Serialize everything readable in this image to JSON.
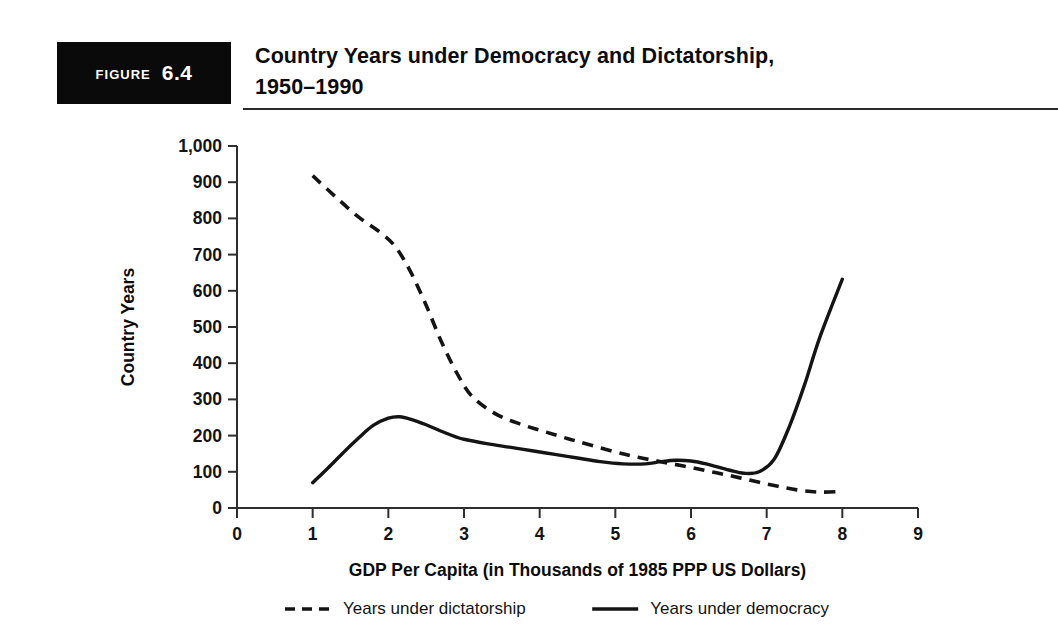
{
  "figure": {
    "tag_word": "Figure",
    "tag_number": "6.4",
    "title_line1": "Country Years under Democracy and Dictatorship,",
    "title_line2": "1950–1990"
  },
  "colors": {
    "tag_background": "#0a0a0a",
    "tag_text": "#ffffff",
    "ink": "#141414",
    "rule": "#2a2a2a",
    "page_background": "#ffffff"
  },
  "chart_data": {
    "type": "line",
    "title": "Country Years under Democracy and Dictatorship, 1950–1990",
    "xlabel": "GDP Per Capita (in Thousands of 1985 PPP US Dollars)",
    "ylabel": "Country Years",
    "xlim": [
      0,
      9
    ],
    "ylim": [
      0,
      1000
    ],
    "xticks": [
      0,
      1,
      2,
      3,
      4,
      5,
      6,
      7,
      8,
      9
    ],
    "xtick_labels": [
      "0",
      "1",
      "2",
      "3",
      "4",
      "5",
      "6",
      "7",
      "8",
      "9"
    ],
    "yticks": [
      0,
      100,
      200,
      300,
      400,
      500,
      600,
      700,
      800,
      900,
      1000
    ],
    "ytick_labels": [
      "0",
      "100",
      "200",
      "300",
      "400",
      "500",
      "600",
      "700",
      "800",
      "900",
      "1,000"
    ],
    "grid": false,
    "legend_position": "bottom",
    "series": [
      {
        "name": "Years under dictatorship",
        "style": "dashed",
        "x": [
          1.0,
          1.3,
          1.6,
          1.9,
          2.1,
          2.3,
          2.5,
          2.7,
          2.9,
          3.1,
          3.4,
          3.7,
          4.0,
          4.3,
          4.6,
          5.0,
          5.3,
          5.6,
          5.9,
          6.2,
          6.5,
          6.8,
          7.1,
          7.4,
          7.7,
          8.0
        ],
        "y": [
          918,
          860,
          805,
          760,
          720,
          650,
          560,
          460,
          375,
          310,
          262,
          235,
          215,
          196,
          178,
          155,
          140,
          128,
          116,
          103,
          90,
          76,
          62,
          50,
          44,
          46
        ]
      },
      {
        "name": "Years under democracy",
        "style": "solid",
        "x": [
          1.0,
          1.2,
          1.4,
          1.6,
          1.8,
          2.0,
          2.15,
          2.3,
          2.5,
          2.7,
          2.9,
          3.0,
          3.3,
          3.6,
          3.9,
          4.2,
          4.5,
          4.8,
          5.1,
          5.4,
          5.6,
          5.8,
          6.0,
          6.2,
          6.5,
          6.7,
          6.9,
          7.1,
          7.3,
          7.5,
          7.7,
          8.0
        ],
        "y": [
          70,
          110,
          152,
          192,
          228,
          248,
          252,
          245,
          230,
          212,
          196,
          190,
          178,
          168,
          158,
          148,
          138,
          128,
          122,
          122,
          128,
          132,
          130,
          122,
          105,
          96,
          100,
          135,
          225,
          340,
          470,
          632
        ]
      }
    ],
    "annotations": []
  },
  "legend": {
    "items": [
      {
        "label": "Years under dictatorship",
        "style": "dashed"
      },
      {
        "label": "Years under democracy",
        "style": "solid"
      }
    ]
  }
}
